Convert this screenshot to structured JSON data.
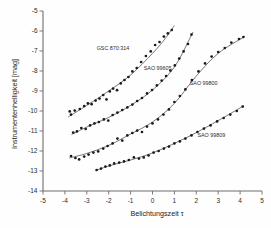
{
  "chart_data": {
    "type": "scatter",
    "title": "",
    "xlabel": "Belichtungszeit τ",
    "ylabel": "Instrumentenhelligkeit [mag]",
    "xlim": [
      -5,
      5
    ],
    "ylim": [
      -14,
      -5
    ],
    "xticks": [
      -5,
      -4,
      -3,
      -2,
      -1,
      0,
      1,
      2,
      3,
      4,
      5
    ],
    "xtick_labels": [
      "-5",
      "-4",
      "-3",
      "-2",
      "-1",
      "0",
      "1",
      "2",
      "3",
      "4",
      "5"
    ],
    "yticks": [
      -14,
      -13,
      -12,
      -11,
      -10,
      -9,
      -8,
      -7,
      -6,
      -5
    ],
    "ytick_labels": [
      "-14",
      "-13",
      "-12",
      "-11",
      "-10",
      "-9",
      "-8",
      "-7",
      "-6",
      "-5"
    ],
    "grid": false,
    "legend": "inline-annotations",
    "marker": "filled-circle",
    "series": [
      {
        "name": "GSC 870:314",
        "label": "GSC 870:314",
        "label_x": -2.55,
        "label_y": -6.95,
        "points": [
          {
            "x": -3.78,
            "y": -10.02
          },
          {
            "x": -3.72,
            "y": -10.18
          },
          {
            "x": -3.55,
            "y": -9.98
          },
          {
            "x": -3.32,
            "y": -9.9
          },
          {
            "x": -3.12,
            "y": -9.75
          },
          {
            "x": -2.95,
            "y": -9.62
          },
          {
            "x": -2.78,
            "y": -9.66
          },
          {
            "x": -2.6,
            "y": -9.48
          },
          {
            "x": -2.42,
            "y": -9.38
          },
          {
            "x": -2.25,
            "y": -9.2
          },
          {
            "x": -2.1,
            "y": -9.42
          },
          {
            "x": -1.95,
            "y": -9.02
          },
          {
            "x": -1.8,
            "y": -8.88
          },
          {
            "x": -1.62,
            "y": -8.96
          },
          {
            "x": -1.45,
            "y": -8.62
          },
          {
            "x": -1.28,
            "y": -8.45
          },
          {
            "x": -1.1,
            "y": -8.3
          },
          {
            "x": -0.92,
            "y": -8.02
          },
          {
            "x": -0.72,
            "y": -7.85
          },
          {
            "x": -0.52,
            "y": -7.55
          },
          {
            "x": -0.3,
            "y": -7.25
          },
          {
            "x": -0.08,
            "y": -7.02
          },
          {
            "x": 0.12,
            "y": -6.7
          },
          {
            "x": 0.32,
            "y": -6.55
          },
          {
            "x": 0.52,
            "y": -6.28
          },
          {
            "x": 0.7,
            "y": -6.12
          },
          {
            "x": 0.88,
            "y": -5.95
          }
        ],
        "fit": [
          {
            "x": -3.85,
            "y": -10.3
          },
          {
            "x": -3.0,
            "y": -9.72
          },
          {
            "x": -2.0,
            "y": -9.0
          },
          {
            "x": -1.0,
            "y": -8.2
          },
          {
            "x": 0.0,
            "y": -7.12
          },
          {
            "x": 0.6,
            "y": -6.35
          },
          {
            "x": 1.0,
            "y": -5.72
          }
        ]
      },
      {
        "name": "SAO 99605",
        "label": "SAO 99605",
        "label_x": -0.4,
        "label_y": -7.95,
        "points": [
          {
            "x": -3.62,
            "y": -11.08
          },
          {
            "x": -3.45,
            "y": -11.02
          },
          {
            "x": -3.25,
            "y": -10.85
          },
          {
            "x": -3.05,
            "y": -10.9
          },
          {
            "x": -2.85,
            "y": -10.72
          },
          {
            "x": -2.65,
            "y": -10.62
          },
          {
            "x": -2.45,
            "y": -10.55
          },
          {
            "x": -2.22,
            "y": -10.42
          },
          {
            "x": -2.02,
            "y": -10.48
          },
          {
            "x": -1.82,
            "y": -10.2
          },
          {
            "x": -1.6,
            "y": -10.08
          },
          {
            "x": -1.38,
            "y": -9.95
          },
          {
            "x": -1.15,
            "y": -9.82
          },
          {
            "x": -0.92,
            "y": -9.68
          },
          {
            "x": -0.7,
            "y": -9.5
          },
          {
            "x": -0.48,
            "y": -9.35
          },
          {
            "x": -0.25,
            "y": -9.12
          },
          {
            "x": -0.02,
            "y": -8.95
          },
          {
            "x": 0.2,
            "y": -8.72
          },
          {
            "x": 0.42,
            "y": -8.48
          },
          {
            "x": 0.62,
            "y": -8.25
          },
          {
            "x": 0.82,
            "y": -7.98
          },
          {
            "x": 1.02,
            "y": -7.72
          },
          {
            "x": 1.22,
            "y": -7.38
          },
          {
            "x": 1.42,
            "y": -7.02
          },
          {
            "x": 1.62,
            "y": -6.65
          },
          {
            "x": 1.78,
            "y": -6.18
          }
        ],
        "fit": [
          {
            "x": -3.7,
            "y": -11.18
          },
          {
            "x": -3.0,
            "y": -10.8
          },
          {
            "x": -2.0,
            "y": -10.32
          },
          {
            "x": -1.0,
            "y": -9.72
          },
          {
            "x": 0.0,
            "y": -8.95
          },
          {
            "x": 1.0,
            "y": -7.8
          },
          {
            "x": 1.85,
            "y": -6.05
          }
        ]
      },
      {
        "name": "SAO 99800",
        "label": "SAO 99800",
        "label_x": 1.7,
        "label_y": -8.72,
        "points": [
          {
            "x": -3.72,
            "y": -12.25
          },
          {
            "x": -3.52,
            "y": -12.35
          },
          {
            "x": -3.35,
            "y": -12.42
          },
          {
            "x": -3.12,
            "y": -12.28
          },
          {
            "x": -2.92,
            "y": -12.18
          },
          {
            "x": -2.7,
            "y": -12.08
          },
          {
            "x": -2.48,
            "y": -12.02
          },
          {
            "x": -2.25,
            "y": -11.88
          },
          {
            "x": -2.05,
            "y": -11.75
          },
          {
            "x": -1.82,
            "y": -11.62
          },
          {
            "x": -1.6,
            "y": -11.38
          },
          {
            "x": -1.38,
            "y": -11.48
          },
          {
            "x": -1.15,
            "y": -11.22
          },
          {
            "x": -0.92,
            "y": -11.1
          },
          {
            "x": -0.7,
            "y": -10.98
          },
          {
            "x": -0.48,
            "y": -11.05
          },
          {
            "x": -0.25,
            "y": -10.78
          },
          {
            "x": 0.0,
            "y": -10.62
          },
          {
            "x": 0.25,
            "y": -10.42
          },
          {
            "x": 0.5,
            "y": -10.18
          },
          {
            "x": 0.75,
            "y": -9.92
          },
          {
            "x": 1.0,
            "y": -9.55
          },
          {
            "x": 1.25,
            "y": -9.25
          },
          {
            "x": 1.5,
            "y": -8.92
          },
          {
            "x": 1.8,
            "y": -8.45
          },
          {
            "x": 2.1,
            "y": -8.02
          },
          {
            "x": 2.4,
            "y": -7.62
          },
          {
            "x": 2.7,
            "y": -7.28
          },
          {
            "x": 3.0,
            "y": -7.05
          },
          {
            "x": 3.3,
            "y": -6.85
          },
          {
            "x": 3.6,
            "y": -6.58
          },
          {
            "x": 3.95,
            "y": -6.4
          },
          {
            "x": 4.15,
            "y": -6.3
          }
        ],
        "fit": [
          {
            "x": -3.8,
            "y": -12.35
          },
          {
            "x": -3.0,
            "y": -12.12
          },
          {
            "x": -2.0,
            "y": -11.72
          },
          {
            "x": -1.0,
            "y": -11.15
          },
          {
            "x": 0.0,
            "y": -10.55
          },
          {
            "x": 1.0,
            "y": -9.62
          },
          {
            "x": 2.0,
            "y": -8.25
          },
          {
            "x": 3.0,
            "y": -7.12
          },
          {
            "x": 4.2,
            "y": -6.28
          }
        ]
      },
      {
        "name": "SAO 99809",
        "label": "SAO 99809",
        "label_x": 2.05,
        "label_y": -11.3,
        "points": [
          {
            "x": -2.55,
            "y": -12.95
          },
          {
            "x": -2.35,
            "y": -12.88
          },
          {
            "x": -2.15,
            "y": -12.78
          },
          {
            "x": -1.95,
            "y": -12.72
          },
          {
            "x": -1.75,
            "y": -12.62
          },
          {
            "x": -1.52,
            "y": -12.58
          },
          {
            "x": -1.3,
            "y": -12.52
          },
          {
            "x": -1.08,
            "y": -12.45
          },
          {
            "x": -0.85,
            "y": -12.32
          },
          {
            "x": -0.62,
            "y": -12.38
          },
          {
            "x": -0.4,
            "y": -12.32
          },
          {
            "x": -0.18,
            "y": -12.22
          },
          {
            "x": 0.05,
            "y": -12.08
          },
          {
            "x": 0.28,
            "y": -12.0
          },
          {
            "x": 0.52,
            "y": -11.88
          },
          {
            "x": 0.75,
            "y": -11.78
          },
          {
            "x": 1.0,
            "y": -11.62
          },
          {
            "x": 1.25,
            "y": -11.52
          },
          {
            "x": 1.5,
            "y": -11.38
          },
          {
            "x": 1.78,
            "y": -11.22
          },
          {
            "x": 2.05,
            "y": -11.05
          },
          {
            "x": 2.35,
            "y": -10.88
          },
          {
            "x": 2.65,
            "y": -10.72
          },
          {
            "x": 2.95,
            "y": -10.52
          },
          {
            "x": 3.25,
            "y": -10.35
          },
          {
            "x": 3.55,
            "y": -10.18
          },
          {
            "x": 3.85,
            "y": -10.0
          },
          {
            "x": 4.12,
            "y": -9.78
          }
        ],
        "fit": [
          {
            "x": -2.6,
            "y": -12.98
          },
          {
            "x": -2.0,
            "y": -12.75
          },
          {
            "x": -1.0,
            "y": -12.45
          },
          {
            "x": 0.0,
            "y": -12.1
          },
          {
            "x": 1.0,
            "y": -11.62
          },
          {
            "x": 2.0,
            "y": -11.08
          },
          {
            "x": 3.0,
            "y": -10.48
          },
          {
            "x": 4.15,
            "y": -9.75
          }
        ]
      }
    ]
  }
}
